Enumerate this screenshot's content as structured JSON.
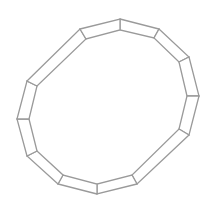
{
  "diagram": {
    "type": "segmented-polygon-ring",
    "segment_count": 12,
    "stroke_color": "#9a9a9a",
    "fill_color": "#ffffff",
    "stroke_width": 1.3,
    "outer_vertices": [
      [
        120,
        19
      ],
      [
        159,
        29
      ],
      [
        189,
        57
      ],
      [
        199,
        96
      ],
      [
        189,
        135
      ],
      [
        137,
        184
      ],
      [
        97,
        194
      ],
      [
        58,
        184
      ],
      [
        27,
        156
      ],
      [
        17,
        119
      ],
      [
        27,
        81
      ],
      [
        80,
        29
      ]
    ],
    "inner_vertices": [
      [
        120,
        30
      ],
      [
        154,
        38
      ],
      [
        179,
        62
      ],
      [
        187,
        96
      ],
      [
        179,
        129
      ],
      [
        132,
        175
      ],
      [
        97,
        184
      ],
      [
        63,
        175
      ],
      [
        37,
        151
      ],
      [
        29,
        119
      ],
      [
        37,
        86
      ],
      [
        86,
        39
      ]
    ]
  }
}
